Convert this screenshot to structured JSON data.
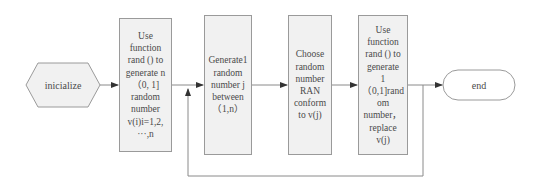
{
  "diagram": {
    "type": "flowchart",
    "start_node": {
      "id": "start",
      "shape": "hexagon",
      "label": "inicialize"
    },
    "end_node": {
      "id": "end",
      "shape": "rounded-pill",
      "label": "end"
    },
    "steps": [
      {
        "id": "step1",
        "label": "Use\nfunction\nrand () to\ngenerate  n\n（0,  1]\nrandom\nnumber\nv(i)i=1,2,\n···,n"
      },
      {
        "id": "step2",
        "label": "Generate1\nrandom\nnumber j\nbetween\n（1,n）"
      },
      {
        "id": "step3",
        "label": "Choose\nrandom\nnumber\nRAN\nconform\nto v(j)"
      },
      {
        "id": "step4",
        "label": "Use\nfunction\nrand () to\ngenerate\n1\n（0,1]rand\nom\nnumber，\nreplace\nv(j)"
      }
    ],
    "edges": [
      {
        "from": "start",
        "to": "step1"
      },
      {
        "from": "step1",
        "to": "step2"
      },
      {
        "from": "step2",
        "to": "step3"
      },
      {
        "from": "step3",
        "to": "step4"
      },
      {
        "from": "step4",
        "to": "end"
      },
      {
        "from": "step4",
        "to": "step2",
        "type": "feedback-loop"
      }
    ],
    "colors": {
      "box_fill": "#f1f1f1",
      "box_border": "#9a9a9a",
      "line": "#8a8a8a",
      "text": "#4a4a4a"
    }
  }
}
